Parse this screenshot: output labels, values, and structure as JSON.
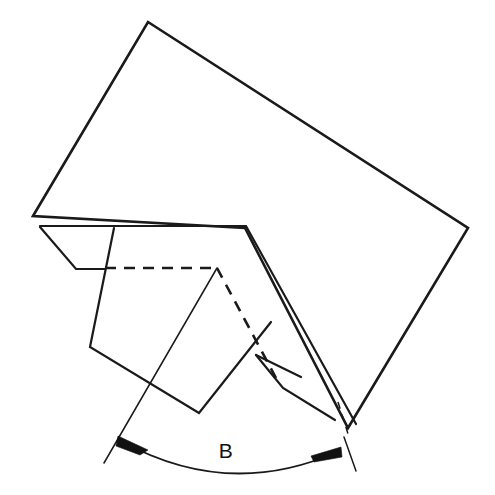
{
  "figure": {
    "background_color": "#ffffff",
    "line_color": "#1a1a1a",
    "width": 495,
    "height": 495
  },
  "dimension": {
    "label": "B",
    "label_x": 226,
    "label_y": 452,
    "kind": "angle",
    "arc_start_x": 120,
    "arc_start_y": 441,
    "arc_end_x": 336,
    "arc_end_y": 452,
    "arrow_count": 2
  },
  "geometry": {
    "main_sheet_outer": "M 33 216 L 148 22 L 468 228 L 348 428 L 245 228 Z",
    "main_sheet_inner": "M 40 226 L 246 226 L 355 422",
    "top_edge_upper": "M 33 216 L 250 219",
    "top_edge_lower": "M 40 226 L 246 226",
    "fold_apex_x": 245,
    "fold_apex_y": 228,
    "hidden_vertex_x": 217,
    "hidden_vertex_y": 268,
    "left_flap": "M 40 227 L 76 269 L 140 269 L 128 227",
    "left_panel": "M 114 228 L 90 347 L 199 413 L 271 322 L 217 268",
    "right_flap": "M 256 355 L 283 387 L 334 420 L 300 377",
    "right_flap_inner": "M 256 355 L 300 377",
    "hidden_horizontal": "M 105 268 L 217 268",
    "hidden_diagonal": "M 217 268 L 276 378",
    "lower_v": "M 199 413 L 271 322",
    "left_leader": "M 217 268 L 105 462",
    "right_leader": "M 340 404 L 355 470",
    "right_leader_dash_break_y": 430
  },
  "colors": {
    "stroke": "#1a1a1a",
    "arrow_fill": "#111111",
    "paper": "#ffffff"
  }
}
